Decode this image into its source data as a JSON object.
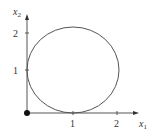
{
  "diagram": {
    "type": "circle-plot",
    "x_axis": {
      "label": "x",
      "subscript": "1",
      "ticks": [
        "1",
        "2"
      ]
    },
    "y_axis": {
      "label": "x",
      "subscript": "2",
      "ticks": [
        "1",
        "2"
      ]
    },
    "circle": {
      "center": [
        1,
        1
      ],
      "radius": 1
    },
    "origin_point": [
      0,
      0
    ],
    "colors": {
      "line": "#555555",
      "point": "#111111"
    }
  }
}
